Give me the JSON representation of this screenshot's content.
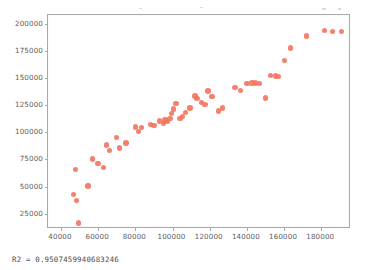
{
  "figure": {
    "background_color": "#ffffff",
    "axes_color": "#a9a9ad",
    "marker_color": "#f1705a",
    "tick_label_color": "#5d5d63",
    "caption": "R2 = 0.9507459940683246"
  },
  "chart_data": {
    "type": "scatter",
    "title": "",
    "xlabel": "",
    "ylabel": "",
    "xlim": [
      33000,
      196000
    ],
    "ylim": [
      11000,
      208000
    ],
    "grid": false,
    "legend": null,
    "xticks": [
      40000,
      60000,
      80000,
      100000,
      120000,
      140000,
      160000,
      180000
    ],
    "yticks": [
      25000,
      50000,
      75000,
      100000,
      125000,
      150000,
      175000,
      200000
    ],
    "xticklabels": [
      "40000",
      "60000",
      "80000",
      "100000",
      "120000",
      "140000",
      "160000",
      "180000"
    ],
    "yticklabels": [
      "25000",
      "50000",
      "75000",
      "100000",
      "125000",
      "150000",
      "175000",
      "200000"
    ],
    "annotations": [
      {
        "text": "R2 = 0.9507459940683246",
        "position": "below-axes-left"
      }
    ],
    "series": [
      {
        "name": "observations",
        "marker": "circle",
        "color": "#f1705a",
        "points": [
          [
            47800,
            66000
          ],
          [
            46600,
            42500
          ],
          [
            48200,
            37500
          ],
          [
            49400,
            16500
          ],
          [
            54600,
            50500
          ],
          [
            56800,
            75500
          ],
          [
            59800,
            71500
          ],
          [
            63000,
            67500
          ],
          [
            64400,
            88500
          ],
          [
            66000,
            83000
          ],
          [
            70000,
            95500
          ],
          [
            71600,
            85500
          ],
          [
            75000,
            90000
          ],
          [
            80000,
            105000
          ],
          [
            81600,
            100500
          ],
          [
            83400,
            104500
          ],
          [
            88000,
            107000
          ],
          [
            90000,
            106500
          ],
          [
            93000,
            110500
          ],
          [
            95200,
            108000
          ],
          [
            96000,
            111500
          ],
          [
            97400,
            110000
          ],
          [
            98600,
            112500
          ],
          [
            99400,
            117500
          ],
          [
            100600,
            121500
          ],
          [
            101800,
            126500
          ],
          [
            104000,
            113000
          ],
          [
            105200,
            114500
          ],
          [
            107000,
            118000
          ],
          [
            109400,
            122500
          ],
          [
            112000,
            133500
          ],
          [
            113200,
            131000
          ],
          [
            115600,
            127500
          ],
          [
            117400,
            125500
          ],
          [
            119000,
            138000
          ],
          [
            121200,
            133000
          ],
          [
            124800,
            119500
          ],
          [
            127000,
            122500
          ],
          [
            133600,
            141500
          ],
          [
            136400,
            138500
          ],
          [
            140000,
            145000
          ],
          [
            142800,
            145500
          ],
          [
            144600,
            145500
          ],
          [
            146800,
            145000
          ],
          [
            150000,
            131500
          ],
          [
            152600,
            152500
          ],
          [
            155400,
            152000
          ],
          [
            157000,
            151500
          ],
          [
            160200,
            166000
          ],
          [
            163600,
            177500
          ],
          [
            172000,
            188500
          ],
          [
            181600,
            193500
          ],
          [
            186000,
            193000
          ],
          [
            190800,
            193000
          ]
        ]
      }
    ]
  }
}
